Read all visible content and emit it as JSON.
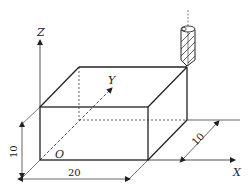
{
  "diagram": {
    "type": "isometric-workpiece-with-tool",
    "axes": {
      "x_label": "X",
      "y_label": "Y",
      "z_label": "Z",
      "origin_label": "O"
    },
    "dimensions": {
      "length": "20",
      "height": "10",
      "width": "10"
    },
    "colors": {
      "line": "#222222",
      "background": "#ffffff"
    }
  }
}
